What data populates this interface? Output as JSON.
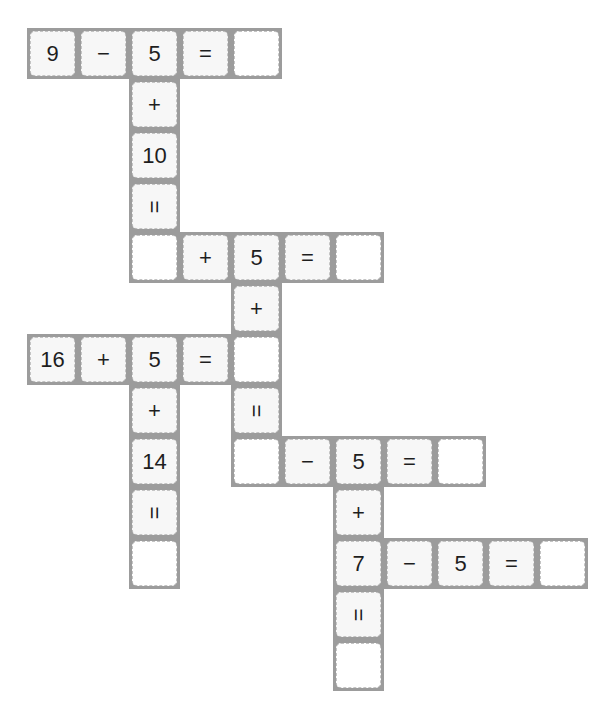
{
  "puzzle": {
    "grid": {
      "origin_x": 27,
      "origin_y": 28,
      "pitch": 51
    },
    "colors": {
      "frame": "#9c9c9c",
      "dash": "#c4c4c4",
      "filled_bg": "#f7f7f7",
      "blank_bg": "#ffffff",
      "text": "#1e1e1e"
    },
    "cells": [
      {
        "col": 0,
        "row": 0,
        "type": "number",
        "value": "9"
      },
      {
        "col": 1,
        "row": 0,
        "type": "operator",
        "value": "−"
      },
      {
        "col": 2,
        "row": 0,
        "type": "number",
        "value": "5"
      },
      {
        "col": 3,
        "row": 0,
        "type": "equals",
        "value": "="
      },
      {
        "col": 4,
        "row": 0,
        "type": "blank",
        "value": ""
      },
      {
        "col": 2,
        "row": 1,
        "type": "operator",
        "value": "+"
      },
      {
        "col": 2,
        "row": 2,
        "type": "number",
        "value": "10"
      },
      {
        "col": 2,
        "row": 3,
        "type": "equals-vertical",
        "value": "="
      },
      {
        "col": 2,
        "row": 4,
        "type": "blank",
        "value": ""
      },
      {
        "col": 3,
        "row": 4,
        "type": "operator",
        "value": "+"
      },
      {
        "col": 4,
        "row": 4,
        "type": "number",
        "value": "5"
      },
      {
        "col": 5,
        "row": 4,
        "type": "equals",
        "value": "="
      },
      {
        "col": 6,
        "row": 4,
        "type": "blank",
        "value": ""
      },
      {
        "col": 4,
        "row": 5,
        "type": "operator",
        "value": "+"
      },
      {
        "col": 0,
        "row": 6,
        "type": "number",
        "value": "16"
      },
      {
        "col": 1,
        "row": 6,
        "type": "operator",
        "value": "+"
      },
      {
        "col": 2,
        "row": 6,
        "type": "number",
        "value": "5"
      },
      {
        "col": 3,
        "row": 6,
        "type": "equals",
        "value": "="
      },
      {
        "col": 4,
        "row": 6,
        "type": "blank",
        "value": ""
      },
      {
        "col": 2,
        "row": 7,
        "type": "operator",
        "value": "+"
      },
      {
        "col": 4,
        "row": 7,
        "type": "equals-vertical",
        "value": "="
      },
      {
        "col": 2,
        "row": 8,
        "type": "number",
        "value": "14"
      },
      {
        "col": 4,
        "row": 8,
        "type": "blank",
        "value": ""
      },
      {
        "col": 5,
        "row": 8,
        "type": "operator",
        "value": "−"
      },
      {
        "col": 6,
        "row": 8,
        "type": "number",
        "value": "5"
      },
      {
        "col": 7,
        "row": 8,
        "type": "equals",
        "value": "="
      },
      {
        "col": 8,
        "row": 8,
        "type": "blank",
        "value": ""
      },
      {
        "col": 2,
        "row": 9,
        "type": "equals-vertical",
        "value": "="
      },
      {
        "col": 6,
        "row": 9,
        "type": "operator",
        "value": "+"
      },
      {
        "col": 2,
        "row": 10,
        "type": "blank",
        "value": ""
      },
      {
        "col": 6,
        "row": 10,
        "type": "number",
        "value": "7"
      },
      {
        "col": 7,
        "row": 10,
        "type": "operator",
        "value": "−"
      },
      {
        "col": 8,
        "row": 10,
        "type": "number",
        "value": "5"
      },
      {
        "col": 9,
        "row": 10,
        "type": "equals",
        "value": "="
      },
      {
        "col": 10,
        "row": 10,
        "type": "blank",
        "value": ""
      },
      {
        "col": 6,
        "row": 11,
        "type": "equals-vertical",
        "value": "="
      },
      {
        "col": 6,
        "row": 12,
        "type": "blank",
        "value": ""
      }
    ]
  }
}
